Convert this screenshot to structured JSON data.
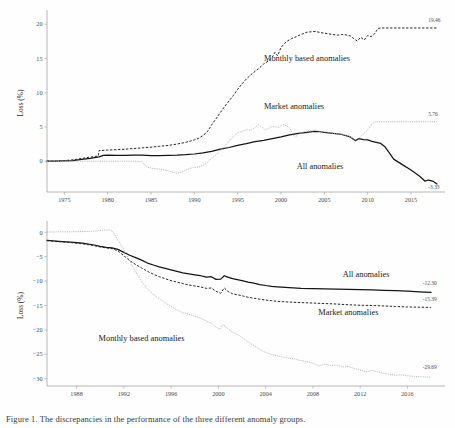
{
  "figure": {
    "caption": "Figure 1. The discrepancies in the performance of the three different anomaly groups.",
    "series_colors": {
      "all_anomalies": "#141414",
      "monthly_based_anomalies": "#262626",
      "market_anomalies": "#b4b4b4"
    }
  },
  "chart_data": [
    {
      "type": "line",
      "id": "top-panel",
      "title": "",
      "xlabel": "",
      "ylabel": "Loss (%)",
      "xlim": [
        1973,
        2018
      ],
      "ylim": [
        -4.5,
        21.5
      ],
      "grid": false,
      "legend": "inline-annotations",
      "xticks": [
        1975,
        1980,
        1985,
        1990,
        1995,
        2000,
        2005,
        2010,
        2015
      ],
      "yticks": [
        0,
        5,
        10,
        15,
        20
      ],
      "annotations": [
        {
          "text": "Monthly based anomalies",
          "x": 2003.0,
          "y": 14.6
        },
        {
          "text": "Market anomalies",
          "x": 2001.5,
          "y": 7.6
        },
        {
          "text": "All anomalies",
          "x": 2004.5,
          "y": -1.1
        }
      ],
      "end_labels": [
        {
          "text": "19.46",
          "series": "Monthly based anomalies",
          "x": 2017.0,
          "y": 20.4
        },
        {
          "text": "5.76",
          "series": "Market anomalies",
          "x": 2017.0,
          "y": 6.6
        },
        {
          "text": "-3.33",
          "series": "All anomalies",
          "x": 2017.0,
          "y": -4.1
        }
      ],
      "series": [
        {
          "name": "All anomalies",
          "style": "solid",
          "x": [
            1973.0,
            1974.0,
            1975.0,
            1976.0,
            1977.0,
            1978.0,
            1979.0,
            1979.5,
            1980.0,
            1981.0,
            1982.0,
            1983.0,
            1984.0,
            1985.0,
            1986.0,
            1987.0,
            1988.0,
            1989.0,
            1990.0,
            1991.0,
            1992.0,
            1993.0,
            1994.0,
            1995.0,
            1996.0,
            1997.0,
            1998.0,
            1999.0,
            2000.0,
            2001.0,
            2002.0,
            2003.0,
            2003.8,
            2004.5,
            2005.0,
            2006.0,
            2007.0,
            2008.0,
            2008.6,
            2009.0,
            2009.5,
            2010.0,
            2010.5,
            2011.0,
            2011.5,
            2012.0,
            2012.5,
            2013.0,
            2014.0,
            2015.0,
            2016.0,
            2016.6,
            2017.0,
            2017.5,
            2018.0
          ],
          "y": [
            0.0,
            0.0,
            0.05,
            0.1,
            0.25,
            0.4,
            0.62,
            0.85,
            0.9,
            0.86,
            0.85,
            0.9,
            0.88,
            0.82,
            0.82,
            0.85,
            0.88,
            0.95,
            1.05,
            1.2,
            1.45,
            1.75,
            2.0,
            2.3,
            2.55,
            2.85,
            3.05,
            3.3,
            3.55,
            3.85,
            4.05,
            4.2,
            4.35,
            4.3,
            4.2,
            4.05,
            3.9,
            3.55,
            3.0,
            3.3,
            3.15,
            3.1,
            2.9,
            2.75,
            2.6,
            2.1,
            1.2,
            0.3,
            -0.5,
            -1.3,
            -2.2,
            -2.9,
            -2.75,
            -2.9,
            -3.33
          ]
        },
        {
          "name": "Monthly based anomalies",
          "style": "dashed",
          "x": [
            1973.0,
            1974.0,
            1975.0,
            1976.0,
            1977.0,
            1978.0,
            1978.9,
            1979.0,
            1979.6,
            1980.0,
            1981.0,
            1982.0,
            1983.0,
            1984.0,
            1985.0,
            1986.0,
            1987.0,
            1988.0,
            1989.0,
            1990.0,
            1990.5,
            1991.0,
            1991.5,
            1992.0,
            1992.5,
            1993.0,
            1993.5,
            1994.0,
            1994.5,
            1995.0,
            1995.5,
            1996.0,
            1996.5,
            1997.0,
            1997.5,
            1998.0,
            1998.5,
            1999.0,
            1999.3,
            1999.6,
            2000.0,
            2000.4,
            2000.8,
            2001.2,
            2001.6,
            2002.0,
            2002.5,
            2003.0,
            2003.5,
            2004.0,
            2004.5,
            2005.0,
            2005.5,
            2006.0,
            2006.5,
            2007.0,
            2007.5,
            2008.0,
            2008.4,
            2008.8,
            2009.2,
            2009.6,
            2010.0,
            2010.4,
            2010.8,
            2011.2,
            2011.6,
            2012.0,
            2013.0,
            2014.0,
            2015.0,
            2016.0,
            2017.0,
            2018.0
          ],
          "y": [
            0.0,
            0.02,
            0.08,
            0.2,
            0.4,
            0.6,
            0.75,
            1.55,
            1.6,
            1.62,
            1.68,
            1.75,
            1.85,
            1.95,
            2.05,
            2.18,
            2.3,
            2.5,
            2.75,
            3.1,
            3.35,
            3.75,
            4.3,
            5.3,
            6.2,
            7.1,
            8.0,
            8.8,
            9.6,
            10.5,
            11.3,
            12.0,
            12.6,
            13.1,
            13.6,
            14.2,
            14.6,
            15.2,
            15.9,
            15.4,
            16.6,
            17.2,
            17.6,
            17.9,
            18.1,
            18.35,
            18.6,
            18.85,
            18.9,
            18.95,
            18.8,
            18.7,
            18.6,
            18.5,
            18.4,
            18.5,
            18.45,
            18.3,
            17.9,
            17.55,
            18.1,
            17.7,
            18.35,
            18.2,
            18.6,
            19.4,
            19.46,
            19.46,
            19.46,
            19.46,
            19.46,
            19.46,
            19.46,
            19.46
          ]
        },
        {
          "name": "Market anomalies",
          "style": "dotted",
          "x": [
            1973.0,
            1975.0,
            1977.0,
            1979.0,
            1981.0,
            1982.0,
            1983.0,
            1983.6,
            1984.0,
            1984.5,
            1985.0,
            1985.5,
            1986.0,
            1986.5,
            1987.0,
            1987.5,
            1988.0,
            1988.5,
            1989.0,
            1989.5,
            1990.0,
            1990.5,
            1991.0,
            1991.5,
            1992.0,
            1992.5,
            1993.0,
            1993.5,
            1994.0,
            1994.5,
            1995.0,
            1995.5,
            1996.0,
            1996.5,
            1997.0,
            1997.4,
            1997.8,
            1998.2,
            1998.6,
            1999.0,
            1999.4,
            1999.8,
            2000.2,
            2000.6,
            2001.0,
            2001.3,
            2001.6,
            2002.0,
            2002.4,
            2002.8,
            2003.2,
            2003.6,
            2004.0,
            2004.5,
            2005.0,
            2005.5,
            2006.0,
            2006.5,
            2007.0,
            2007.5,
            2008.0,
            2008.4,
            2008.8,
            2009.2,
            2009.6,
            2010.0,
            2010.4,
            2010.8,
            2011.2,
            2011.6,
            2012.0,
            2013.0,
            2014.0,
            2015.0,
            2016.0,
            2017.0,
            2018.0
          ],
          "y": [
            0.0,
            0.0,
            0.0,
            0.0,
            0.0,
            0.0,
            0.0,
            -0.05,
            -0.1,
            -0.85,
            -1.0,
            -1.1,
            -1.15,
            -1.25,
            -1.4,
            -1.6,
            -1.75,
            -1.6,
            -1.3,
            -1.05,
            -0.9,
            -0.85,
            -0.6,
            -0.2,
            0.4,
            0.95,
            1.6,
            2.2,
            2.9,
            3.6,
            4.2,
            4.35,
            4.6,
            4.5,
            4.9,
            5.3,
            5.0,
            4.6,
            4.8,
            5.1,
            5.0,
            4.95,
            5.4,
            5.2,
            4.85,
            4.1,
            3.5,
            3.9,
            4.2,
            4.35,
            4.45,
            4.4,
            4.5,
            4.4,
            4.3,
            4.2,
            4.1,
            4.0,
            3.9,
            3.8,
            3.6,
            3.2,
            3.0,
            3.6,
            4.1,
            4.6,
            5.3,
            5.76,
            5.76,
            5.76,
            5.76,
            5.76,
            5.76,
            5.76,
            5.76,
            5.76,
            5.76
          ]
        }
      ]
    },
    {
      "type": "line",
      "id": "bottom-panel",
      "title": "",
      "xlabel": "",
      "ylabel": "Loss (%)",
      "xlim": [
        1985.5,
        2018.5
      ],
      "ylim": [
        -31.5,
        1.5
      ],
      "grid": false,
      "legend": "inline-annotations",
      "xticks": [
        1988,
        1992,
        1996,
        2000,
        2004,
        2008,
        2012,
        2016
      ],
      "yticks": [
        0,
        -5,
        -10,
        -15,
        -20,
        -25,
        -30
      ],
      "annotations": [
        {
          "text": "All anomalies",
          "x": 2012.5,
          "y": -9.2
        },
        {
          "text": "Market anomalies",
          "x": 2011.0,
          "y": -16.9
        },
        {
          "text": "Monthly based anomalies",
          "x": 1993.5,
          "y": -22.3
        }
      ],
      "end_labels": [
        {
          "text": "-12.30",
          "series": "All anomalies",
          "x": 2017.3,
          "y": -10.9
        },
        {
          "text": "-15.39",
          "series": "Market anomalies",
          "x": 2017.3,
          "y": -14.1
        },
        {
          "text": "-29.69",
          "series": "Monthly based anomalies",
          "x": 2017.3,
          "y": -28.1
        }
      ],
      "series": [
        {
          "name": "All anomalies",
          "style": "solid",
          "x": [
            1985.5,
            1986.5,
            1987.5,
            1988.5,
            1989.5,
            1990.0,
            1990.5,
            1991.0,
            1991.5,
            1992.0,
            1992.5,
            1993.0,
            1993.5,
            1994.0,
            1994.5,
            1995.0,
            1995.5,
            1996.0,
            1996.5,
            1997.0,
            1997.5,
            1998.0,
            1998.5,
            1999.0,
            1999.4,
            1999.8,
            2000.2,
            2000.5,
            2000.8,
            2001.2,
            2001.6,
            2002.0,
            2002.5,
            2003.0,
            2003.5,
            2004.0,
            2004.5,
            2005.0,
            2006.0,
            2007.0,
            2008.0,
            2009.0,
            2010.0,
            2011.0,
            2012.0,
            2013.0,
            2014.0,
            2015.0,
            2016.0,
            2017.0,
            2018.0
          ],
          "y": [
            -1.65,
            -1.85,
            -2.0,
            -2.2,
            -2.6,
            -2.9,
            -3.1,
            -3.2,
            -3.5,
            -4.1,
            -4.7,
            -5.2,
            -5.7,
            -6.3,
            -6.7,
            -7.1,
            -7.4,
            -7.7,
            -8.0,
            -8.3,
            -8.5,
            -8.7,
            -8.9,
            -9.2,
            -9.1,
            -9.65,
            -9.6,
            -8.9,
            -9.2,
            -9.5,
            -9.7,
            -9.9,
            -10.2,
            -10.4,
            -10.7,
            -10.9,
            -11.1,
            -11.2,
            -11.35,
            -11.5,
            -11.55,
            -11.6,
            -11.65,
            -11.7,
            -11.75,
            -11.8,
            -11.9,
            -11.95,
            -12.05,
            -12.2,
            -12.3
          ]
        },
        {
          "name": "Market anomalies",
          "style": "dashed",
          "x": [
            1985.5,
            1986.5,
            1987.5,
            1988.5,
            1989.5,
            1990.0,
            1990.5,
            1991.0,
            1991.5,
            1992.0,
            1992.5,
            1993.0,
            1993.5,
            1994.0,
            1994.5,
            1995.0,
            1995.5,
            1996.0,
            1996.5,
            1997.0,
            1997.5,
            1998.0,
            1998.5,
            1999.0,
            1999.4,
            1999.8,
            2000.2,
            2000.5,
            2000.8,
            2001.2,
            2001.6,
            2002.0,
            2002.5,
            2003.0,
            2003.5,
            2004.0,
            2004.5,
            2005.0,
            2006.0,
            2007.0,
            2008.0,
            2009.0,
            2010.0,
            2011.0,
            2012.0,
            2013.0,
            2014.0,
            2015.0,
            2016.0,
            2017.0,
            2018.0
          ],
          "y": [
            -1.7,
            -1.9,
            -2.1,
            -2.35,
            -2.75,
            -3.0,
            -3.2,
            -3.35,
            -3.8,
            -4.8,
            -5.8,
            -6.6,
            -7.3,
            -8.0,
            -8.6,
            -9.1,
            -9.5,
            -9.9,
            -10.2,
            -10.5,
            -10.8,
            -11.0,
            -11.2,
            -11.5,
            -11.4,
            -12.1,
            -12.5,
            -11.4,
            -12.1,
            -12.6,
            -12.8,
            -13.0,
            -13.3,
            -13.5,
            -13.7,
            -13.9,
            -14.0,
            -14.15,
            -14.3,
            -14.4,
            -14.5,
            -14.6,
            -14.7,
            -14.85,
            -14.95,
            -15.0,
            -15.1,
            -15.2,
            -15.3,
            -15.35,
            -15.39
          ]
        },
        {
          "name": "Monthly based anomalies",
          "style": "dotted",
          "x": [
            1985.5,
            1986.5,
            1987.5,
            1988.5,
            1989.2,
            1989.8,
            1990.3,
            1990.8,
            1991.0,
            1991.3,
            1991.6,
            1992.0,
            1992.4,
            1992.8,
            1993.2,
            1993.6,
            1994.0,
            1994.4,
            1994.8,
            1995.2,
            1995.6,
            1996.0,
            1996.5,
            1997.0,
            1997.5,
            1998.0,
            1998.5,
            1999.0,
            1999.4,
            1999.8,
            2000.1,
            2000.4,
            2000.7,
            2001.0,
            2001.4,
            2001.8,
            2002.2,
            2002.6,
            2003.0,
            2003.4,
            2003.8,
            2004.2,
            2004.6,
            2005.0,
            2005.5,
            2006.0,
            2006.5,
            2007.0,
            2007.5,
            2008.0,
            2008.5,
            2009.0,
            2009.5,
            2010.0,
            2010.5,
            2011.0,
            2011.5,
            2012.0,
            2012.5,
            2013.0,
            2013.5,
            2014.0,
            2014.5,
            2015.0,
            2015.5,
            2016.0,
            2016.5,
            2017.0,
            2017.5,
            2018.0
          ],
          "y": [
            0.05,
            0.1,
            0.1,
            0.15,
            0.2,
            0.3,
            0.45,
            0.5,
            0.3,
            -0.8,
            -1.9,
            -3.6,
            -5.4,
            -7.2,
            -9.0,
            -10.4,
            -11.6,
            -12.5,
            -13.3,
            -14.0,
            -14.6,
            -15.2,
            -15.9,
            -16.5,
            -16.8,
            -17.2,
            -17.6,
            -18.2,
            -18.6,
            -19.4,
            -19.9,
            -18.9,
            -19.5,
            -20.2,
            -20.7,
            -21.2,
            -21.9,
            -22.6,
            -23.2,
            -23.8,
            -24.4,
            -24.8,
            -25.1,
            -25.3,
            -25.6,
            -25.8,
            -26.0,
            -26.3,
            -26.5,
            -26.8,
            -27.4,
            -27.0,
            -27.3,
            -27.2,
            -27.6,
            -27.5,
            -27.9,
            -28.2,
            -28.6,
            -28.3,
            -28.6,
            -28.9,
            -29.1,
            -29.3,
            -29.2,
            -29.4,
            -29.5,
            -29.6,
            -29.65,
            -29.69
          ]
        }
      ]
    }
  ]
}
